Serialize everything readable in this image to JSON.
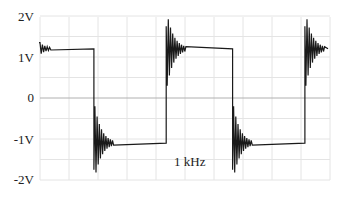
{
  "chart_data": {
    "type": "line",
    "title": "",
    "xlabel": "",
    "ylabel": "",
    "y_ticks": [
      "2V",
      "1V",
      "0",
      "-1V",
      "-2V"
    ],
    "y_tick_values": [
      2,
      1,
      0,
      -1,
      -2
    ],
    "ylim": [
      -2.3,
      2.3
    ],
    "grid": true,
    "annotation": "1 kHz",
    "series": [
      {
        "name": "square wave with ringing",
        "description": "Square wave alternating between ~+1.2V and ~-1.1V with damped ringing overshoot (~±1.75V peak) after each transition",
        "high_level": 1.2,
        "low_level": -1.1,
        "overshoot_peak": 1.75,
        "transitions": [
          {
            "type": "falling",
            "x_frac": 0.19
          },
          {
            "type": "rising",
            "x_frac": 0.44
          },
          {
            "type": "falling",
            "x_frac": 0.67
          },
          {
            "type": "rising",
            "x_frac": 0.92
          }
        ]
      }
    ]
  },
  "colors": {
    "trace": "#1a1a1a",
    "grid": "#e4e4e4",
    "zero_line": "#b0b0b0",
    "text": "#222222"
  }
}
